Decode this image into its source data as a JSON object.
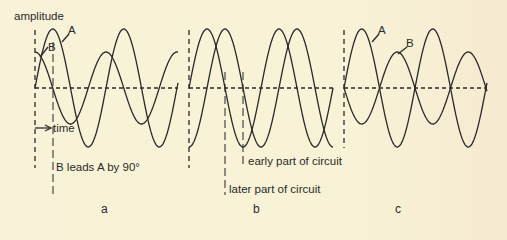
{
  "axis": {
    "ylabel": "amplitude",
    "xlabel": "time"
  },
  "panels": [
    {
      "id": "a",
      "label": "a",
      "wave_labels": [
        "A",
        "B"
      ],
      "annotation": "B leads A by 90°",
      "description": "Wave B (smaller amplitude) leads wave A by 90 degrees"
    },
    {
      "id": "b",
      "label": "b",
      "annotations": [
        "early part of circuit",
        "later part of circuit"
      ],
      "description": "Same waveform at early and later points of a circuit, phase shifted"
    },
    {
      "id": "c",
      "label": "c",
      "wave_labels": [
        "A",
        "B"
      ],
      "description": "Waves A and B 180 degrees out of phase, B smaller amplitude"
    }
  ],
  "colors": {
    "background": "#f8f3d8",
    "stroke": "#2a2a2a"
  }
}
